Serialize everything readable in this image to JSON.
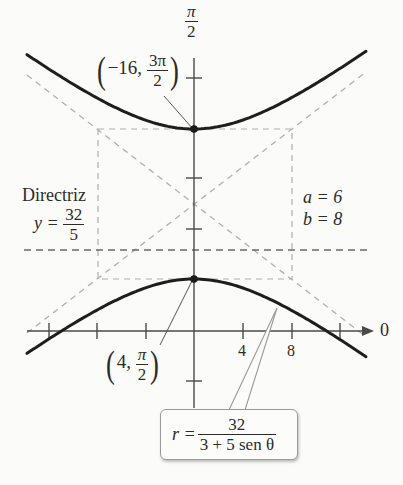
{
  "chart_data": {
    "type": "line",
    "title": "",
    "equation": {
      "lhs": "r =",
      "numerator": "32",
      "denominator": "3 + 5 sen θ"
    },
    "axes": {
      "polar_axis_label": "0",
      "vertical_axis_label_num": "π",
      "vertical_axis_label_den": "2",
      "x_tick_labels": [
        "4",
        "8"
      ],
      "x_ticks": [
        -12,
        -8,
        -4,
        4,
        8,
        12
      ]
    },
    "vertices": [
      {
        "label_r": "−16,",
        "label_theta_num": "3π",
        "label_theta_den": "2",
        "x": 0,
        "y": 10
      },
      {
        "label_r": "4,",
        "label_theta_num": "π",
        "label_theta_den": "2",
        "x": 0,
        "y": 4
      }
    ],
    "center": {
      "x": 0,
      "y": 7
    },
    "directrix": {
      "title": "Directriz",
      "lhs": "y =",
      "num": "32",
      "den": "5",
      "value": 6.4
    },
    "params": {
      "a_label": "a = 6",
      "b_label": "b = 8",
      "a": 6,
      "b": 8
    },
    "colors": {
      "curve": "#1e1e1e",
      "axis": "#444444",
      "dashed": "#a8a8a8",
      "directrix": "#6a6a6a"
    }
  }
}
